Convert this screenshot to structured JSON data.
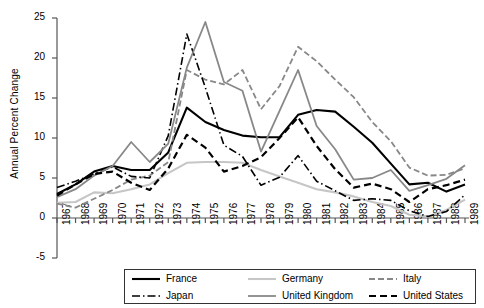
{
  "chart_data": {
    "type": "line",
    "title": "",
    "xlabel": "",
    "ylabel": "Annual Percent Change",
    "xlim": [
      1967,
      1989
    ],
    "ylim": [
      -5,
      25
    ],
    "yticks": [
      -5,
      0,
      5,
      10,
      15,
      20,
      25
    ],
    "grid": false,
    "legend_position": "bottom",
    "x": [
      1967,
      1968,
      1969,
      1970,
      1971,
      1972,
      1973,
      1974,
      1975,
      1976,
      1977,
      1978,
      1979,
      1980,
      1981,
      1982,
      1983,
      1984,
      1985,
      1986,
      1987,
      1988,
      1989
    ],
    "categories": [
      "1967",
      "1968",
      "1969",
      "1970",
      "1971",
      "1972",
      "1973",
      "1974",
      "1975",
      "1976",
      "1977",
      "1978",
      "1979",
      "1980",
      "1981",
      "1982",
      "1983",
      "1984",
      "1985",
      "1986",
      "1987",
      "1988",
      "1989"
    ],
    "series": [
      {
        "name": "France",
        "color": "#000000",
        "style": "solid",
        "width": 2.1,
        "values": [
          3.0,
          4.2,
          5.8,
          6.5,
          6.0,
          6.0,
          8.2,
          13.8,
          12.0,
          11.0,
          10.3,
          10.1,
          10.1,
          12.9,
          13.5,
          13.3,
          11.4,
          9.4,
          6.8,
          4.2,
          4.4,
          3.3,
          4.2
        ]
      },
      {
        "name": "Germany",
        "color": "#c6c6c6",
        "style": "solid",
        "width": 2.1,
        "values": [
          1.9,
          2.0,
          3.2,
          3.1,
          3.6,
          4.2,
          5.6,
          6.9,
          7.0,
          7.0,
          6.9,
          6.0,
          5.2,
          4.4,
          3.6,
          3.2,
          2.7,
          2.0,
          1.5,
          0.4,
          0.2,
          1.0,
          2.3
        ]
      },
      {
        "name": "Italy",
        "color": "#888888",
        "style": "dashed",
        "width": 1.8,
        "values": [
          1.8,
          1.3,
          2.4,
          3.5,
          4.8,
          5.3,
          7.0,
          18.5,
          17.3,
          16.7,
          18.5,
          13.6,
          16.5,
          21.4,
          19.6,
          17.3,
          15.1,
          12.0,
          9.6,
          6.3,
          5.3,
          5.4,
          6.2
        ]
      },
      {
        "name": "Japan",
        "color": "#000000",
        "style": "dashdot",
        "width": 1.6,
        "values": [
          3.8,
          4.6,
          5.5,
          6.4,
          5.2,
          5.0,
          10.3,
          23.0,
          16.3,
          9.1,
          7.7,
          4.1,
          5.1,
          7.8,
          4.6,
          3.4,
          2.2,
          2.4,
          2.2,
          0.9,
          0.2,
          0.8,
          2.9
        ]
      },
      {
        "name": "United Kingdom",
        "color": "#888888",
        "style": "solid",
        "width": 1.8,
        "values": [
          2.6,
          3.6,
          5.3,
          6.5,
          9.5,
          7.0,
          9.3,
          18.8,
          24.5,
          17.0,
          15.9,
          8.3,
          13.4,
          18.5,
          11.5,
          8.6,
          4.8,
          5.0,
          6.0,
          3.4,
          4.1,
          4.9,
          6.6
        ]
      },
      {
        "name": "United States",
        "color": "#000000",
        "style": "dashed-thick",
        "width": 2.2,
        "values": [
          2.8,
          4.2,
          5.5,
          5.8,
          4.4,
          3.5,
          6.2,
          10.4,
          8.8,
          5.8,
          6.5,
          7.6,
          10.0,
          12.6,
          9.0,
          6.1,
          3.8,
          4.3,
          3.6,
          2.0,
          3.6,
          4.1,
          4.8
        ]
      }
    ]
  },
  "legend": {
    "entries": [
      {
        "label": "France",
        "style": "solid",
        "color": "#000000",
        "width": 2.1
      },
      {
        "label": "Germany",
        "style": "solid",
        "color": "#c6c6c6",
        "width": 2.1
      },
      {
        "label": "Italy",
        "style": "dashed",
        "color": "#888888",
        "width": 1.8
      },
      {
        "label": "Japan",
        "style": "dashdot",
        "color": "#000000",
        "width": 1.6
      },
      {
        "label": "United Kingdom",
        "style": "solid",
        "color": "#888888",
        "width": 1.8
      },
      {
        "label": "United States",
        "style": "dashed-thick",
        "color": "#000000",
        "width": 2.2
      }
    ]
  },
  "axis": {
    "y_label": "Annual Percent Change",
    "y_tick_labels": [
      "25",
      "20",
      "15",
      "10",
      "5",
      "0",
      "-5"
    ],
    "x_tick_labels": [
      "1967",
      "1968",
      "1969",
      "1970",
      "1971",
      "1972",
      "1973",
      "1974",
      "1975",
      "1976",
      "1977",
      "1978",
      "1979",
      "1980",
      "1981",
      "1982",
      "1983",
      "1984",
      "1985",
      "1986",
      "1987",
      "1988",
      "1989"
    ]
  },
  "colors": {
    "axis": "#555555",
    "black": "#000000",
    "light_gray": "#c6c6c6",
    "mid_gray": "#888888",
    "background": "#ffffff"
  }
}
